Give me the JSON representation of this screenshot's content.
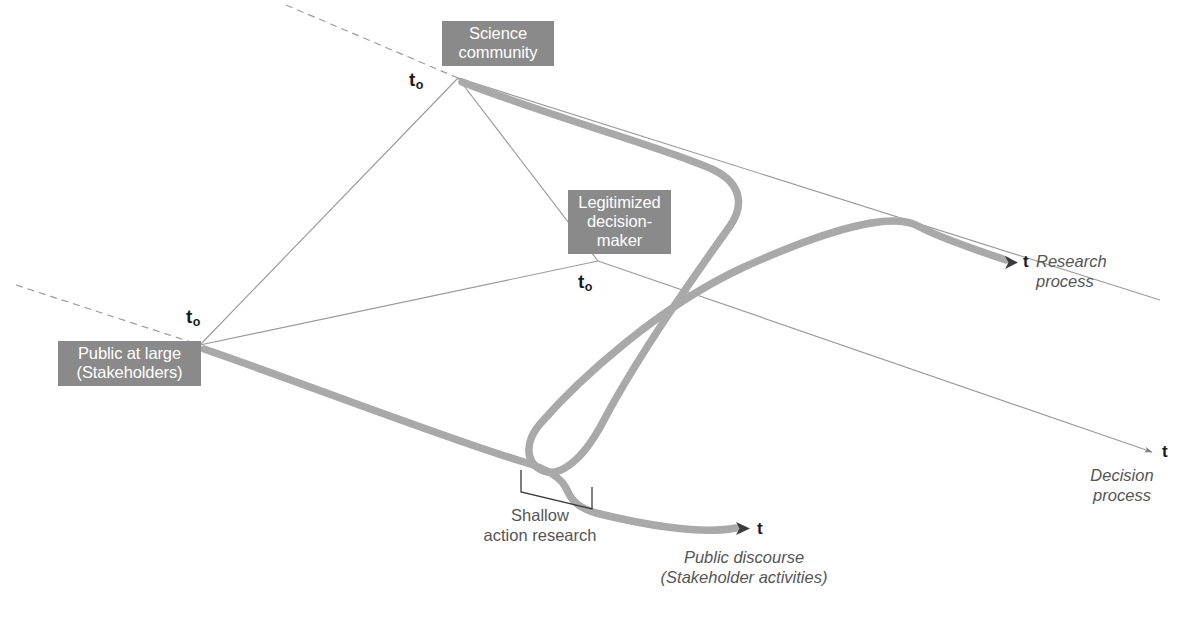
{
  "figure": {
    "type": "conceptual-diagram",
    "background_color": "#ffffff",
    "node_fill_color": "#8a8a8a",
    "node_text_color": "#ffffff",
    "thick_curve_color": "#a8a8a8",
    "thin_line_color": "#9a9a9a",
    "text_color": "#555555"
  },
  "nodes": [
    {
      "id": "science-community",
      "label": "Science\ncommunity",
      "time_label": "t",
      "time_subscript": "o"
    },
    {
      "id": "legitimized-decision-maker",
      "label": "Legitimized\ndecision-\nmaker",
      "time_label": "t",
      "time_subscript": "o"
    },
    {
      "id": "public-at-large",
      "label": "Public at large\n(Stakeholders)",
      "time_label": "t",
      "time_subscript": "o"
    }
  ],
  "axes": [
    {
      "id": "research-process",
      "tick_label": "t",
      "caption": "Research\nprocess"
    },
    {
      "id": "decision-process",
      "tick_label": "t",
      "caption": "Decision\nprocess"
    },
    {
      "id": "public-discourse",
      "tick_label": "t",
      "caption": "Public discourse\n(Stakeholder activities)"
    }
  ],
  "annotations": [
    {
      "id": "shallow-action-research",
      "label": "Shallow\naction research",
      "marker": "bracket"
    }
  ]
}
